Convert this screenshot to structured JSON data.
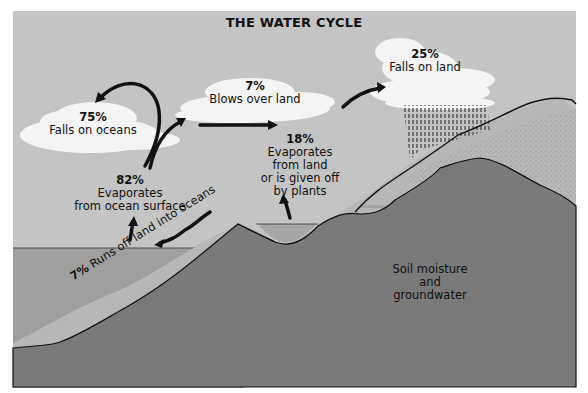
{
  "title": "THE WATER CYCLE",
  "colors": {
    "sky": "#c4c4c4",
    "cloud": "#f4f4f4",
    "ocean": "#9f9f9f",
    "land_light": "#b7b7b7",
    "ground": "#7a7a7a",
    "outline": "#111111"
  },
  "labels": {
    "falls_on_oceans": {
      "pct": "75%",
      "text": "Falls on oceans"
    },
    "blows_over_land": {
      "pct": "7%",
      "text": "Blows over land"
    },
    "falls_on_land": {
      "pct": "25%",
      "text": "Falls on land"
    },
    "evaporates_ocean": {
      "pct": "82%",
      "line1": "Evaporates",
      "line2": "from ocean surface"
    },
    "evaporates_land": {
      "pct": "18%",
      "line1": "Evaporates",
      "line2": "from land",
      "line3": "or is given off",
      "line4": "by plants"
    },
    "runs_off": {
      "pct": "7%",
      "text": "Runs off land  into oceans"
    },
    "soil": {
      "line1": "Soil moisture",
      "line2": "and",
      "line3": "groundwater"
    }
  }
}
